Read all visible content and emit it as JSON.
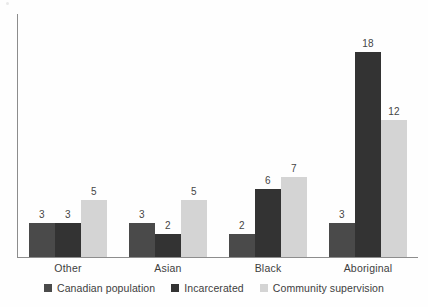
{
  "chart_data": {
    "type": "bar",
    "title": "",
    "subtitle": "",
    "xlabel": "",
    "ylabel": "",
    "categories": [
      "Other",
      "Asian",
      "Black",
      "Aboriginal"
    ],
    "series": [
      {
        "name": "Canadian population",
        "color": "#4a4a4a",
        "values": [
          3,
          3,
          2,
          3
        ]
      },
      {
        "name": "Incarcerated",
        "color": "#333333",
        "values": [
          3,
          2,
          6,
          18
        ]
      },
      {
        "name": "Community supervision",
        "color": "#d4d4d4",
        "values": [
          5,
          5,
          7,
          12
        ]
      }
    ],
    "value_labels_shown": true,
    "ylim": [
      0,
      20
    ],
    "grid": false,
    "y_axis_ticks_shown": false,
    "legend_position": "bottom-center",
    "axis_color": "#8d8d8d",
    "background": "#ffffff"
  },
  "legend": {
    "items": [
      {
        "label": "Canadian population",
        "color": "#4a4a4a"
      },
      {
        "label": "Incarcerated",
        "color": "#333333"
      },
      {
        "label": "Community supervision",
        "color": "#d4d4d4"
      }
    ]
  }
}
